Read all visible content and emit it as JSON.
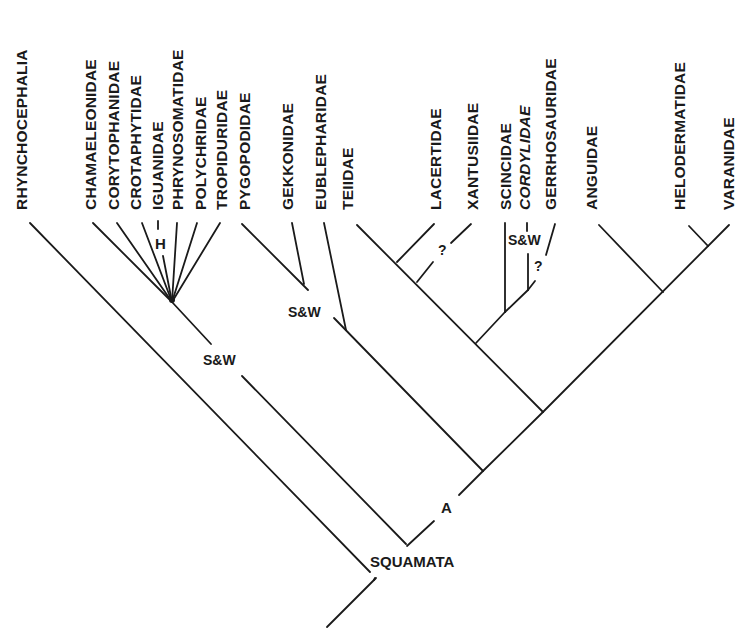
{
  "figure": {
    "type": "phylogenetic-cladogram",
    "root_clade": "SQUAMATA"
  },
  "taxa": [
    {
      "name": "RHYNCHOCEPHALIA",
      "italic": false
    },
    {
      "name": "CHAMAELEONIDAE",
      "italic": false
    },
    {
      "name": "CORYTOPHANIDAE",
      "italic": false
    },
    {
      "name": "CROTAPHYTIDAE",
      "italic": false
    },
    {
      "name": "IGUANIDAE",
      "italic": false
    },
    {
      "name": "PHRYNOSOMATIDAE",
      "italic": false
    },
    {
      "name": "POLYCHRIDAE",
      "italic": false
    },
    {
      "name": "TROPIDURIDAE",
      "italic": false
    },
    {
      "name": "PYGOPODIDAE",
      "italic": false
    },
    {
      "name": "GEKKONIDAE",
      "italic": false
    },
    {
      "name": "EUBLEPHARIDAE",
      "italic": false
    },
    {
      "name": "TEIIDAE",
      "italic": false
    },
    {
      "name": "LACERTIDAE",
      "italic": false
    },
    {
      "name": "XANTUSIIDAE",
      "italic": false
    },
    {
      "name": "SCINCIDAE",
      "italic": false
    },
    {
      "name": "CORDYLIDAE",
      "italic": true
    },
    {
      "name": "GERRHOSAURIDAE",
      "italic": false
    },
    {
      "name": "ANGUIDAE",
      "italic": false
    },
    {
      "name": "HELODERMATIDAE",
      "italic": false
    },
    {
      "name": "VARANIDAE",
      "italic": false
    }
  ],
  "annotations": {
    "iguanidae_mark": "H",
    "sw_iguania": "S&W",
    "sw_gekkota": "S&W",
    "sw_scincomorpha": "S&W",
    "q_xantusiidae": "?",
    "q_gerrhosauridae": "?",
    "node_a": "A",
    "node_squamata": "SQUAMATA"
  }
}
